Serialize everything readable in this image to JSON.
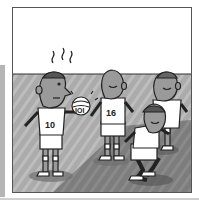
{
  "illustration": {
    "subject": "cartoon volleyball players on a court",
    "style": "grayscale line art",
    "players": [
      {
        "jersey_number": "10",
        "pose": "holding ball, looking worried"
      },
      {
        "jersey_number": "16",
        "pose": "standing, arms out"
      },
      {
        "jersey_number": "",
        "pose": "standing in back"
      },
      {
        "jersey_number": "",
        "pose": "crouching, ready position"
      }
    ],
    "ball_label": "IOI"
  },
  "colors": {
    "wall": "#ffffff",
    "floor": "#a9a9a9",
    "floor_dark": "#777777",
    "outline": "#222222",
    "skin": "#9a9a9a"
  }
}
